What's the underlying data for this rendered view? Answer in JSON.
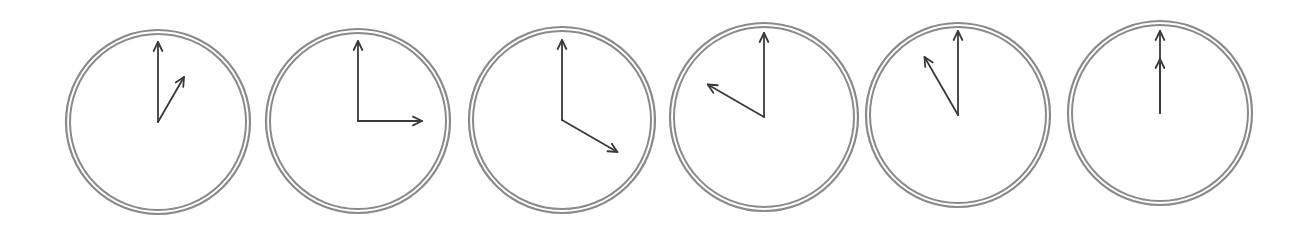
{
  "figure": {
    "ring_color": "#8a8a8a",
    "hand_color": "#3a3a3a",
    "clocks": [
      {
        "id": 1,
        "time": "1:00",
        "hour": 1,
        "minute": 0,
        "cx": 158,
        "cy": 122,
        "r": 92,
        "hour_len": 52,
        "min_len": 80
      },
      {
        "id": 2,
        "time": "3:00",
        "hour": 3,
        "minute": 0,
        "cx": 358,
        "cy": 121,
        "r": 92,
        "hour_len": 64,
        "min_len": 80
      },
      {
        "id": 3,
        "time": "4:00",
        "hour": 4,
        "minute": 0,
        "cx": 562,
        "cy": 120,
        "r": 93,
        "hour_len": 64,
        "min_len": 80
      },
      {
        "id": 4,
        "time": "10:00",
        "hour": 10,
        "minute": 0,
        "cx": 764,
        "cy": 117,
        "r": 94,
        "hour_len": 65,
        "min_len": 84
      },
      {
        "id": 5,
        "time": "11:00",
        "hour": 11,
        "minute": 0,
        "cx": 958,
        "cy": 115,
        "r": 92,
        "hour_len": 67,
        "min_len": 84
      },
      {
        "id": 6,
        "time": "12:00",
        "hour": 12,
        "minute": 0,
        "cx": 1160,
        "cy": 113,
        "r": 92,
        "hour_len": 54,
        "min_len": 82
      }
    ]
  }
}
